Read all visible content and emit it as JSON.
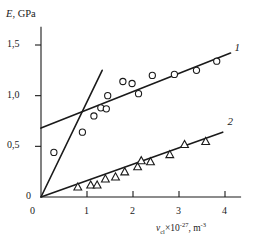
{
  "chart_data": {
    "type": "scatter",
    "title": "",
    "xlabel": "ν_cl×10⁻²⁷, m⁻³",
    "xlabel_parts": {
      "symbol": "ν",
      "subscript": "cl",
      "times_factor": "×10",
      "factor_exponent": "-27",
      "separator": ", ",
      "unit": "m",
      "unit_exponent": "-3"
    },
    "ylabel": "E, GPa",
    "ylabel_parts": {
      "symbol": "E",
      "separator": ", ",
      "unit": "GPa"
    },
    "xlim": [
      0,
      4.35
    ],
    "ylim": [
      0,
      1.68
    ],
    "grid": false,
    "legend_position": "inline-right",
    "xticks": [
      0,
      1,
      2,
      3,
      4
    ],
    "xticklabels": [
      "0",
      "1",
      "2",
      "3",
      "4"
    ],
    "yticks": [
      0,
      0.5,
      1.0,
      1.5
    ],
    "yticklabels": [
      "0",
      "0,5",
      "1,0",
      "1,5"
    ],
    "series": [
      {
        "name": "1",
        "label": "1",
        "marker": "open-circle",
        "color": "#1a1a1a",
        "points": [
          {
            "x": 0.28,
            "y": 0.44
          },
          {
            "x": 0.9,
            "y": 0.64
          },
          {
            "x": 1.15,
            "y": 0.8
          },
          {
            "x": 1.3,
            "y": 0.88
          },
          {
            "x": 1.42,
            "y": 0.87
          },
          {
            "x": 1.45,
            "y": 1.0
          },
          {
            "x": 1.78,
            "y": 1.14
          },
          {
            "x": 1.98,
            "y": 1.12
          },
          {
            "x": 2.12,
            "y": 1.02
          },
          {
            "x": 2.42,
            "y": 1.2
          },
          {
            "x": 2.9,
            "y": 1.21
          },
          {
            "x": 3.38,
            "y": 1.25
          },
          {
            "x": 3.82,
            "y": 1.34
          }
        ]
      },
      {
        "name": "2",
        "label": "2",
        "marker": "open-triangle",
        "color": "#1a1a1a",
        "points": [
          {
            "x": 0.8,
            "y": 0.1
          },
          {
            "x": 1.08,
            "y": 0.12
          },
          {
            "x": 1.22,
            "y": 0.12
          },
          {
            "x": 1.4,
            "y": 0.18
          },
          {
            "x": 1.62,
            "y": 0.2
          },
          {
            "x": 1.82,
            "y": 0.25
          },
          {
            "x": 2.1,
            "y": 0.3
          },
          {
            "x": 2.18,
            "y": 0.36
          },
          {
            "x": 2.38,
            "y": 0.35
          },
          {
            "x": 2.8,
            "y": 0.42
          },
          {
            "x": 3.12,
            "y": 0.52
          },
          {
            "x": 3.58,
            "y": 0.55
          }
        ]
      }
    ],
    "fit_lines": [
      {
        "name": "line-1-shallow",
        "for_series": "1",
        "x0": 0.0,
        "y0": 0.68,
        "x1": 4.12,
        "y1": 1.42
      },
      {
        "name": "line-steep-through-origin",
        "for_series": "1",
        "x0": 0.0,
        "y0": 0.0,
        "x1": 1.33,
        "y1": 1.25
      },
      {
        "name": "line-2",
        "for_series": "2",
        "x0": 0.0,
        "y0": 0.0,
        "x1": 3.95,
        "y1": 0.64
      }
    ],
    "annotations": [
      {
        "text": "1",
        "x": 4.25,
        "y": 1.46
      },
      {
        "text": "2",
        "x": 4.1,
        "y": 0.73
      }
    ]
  }
}
